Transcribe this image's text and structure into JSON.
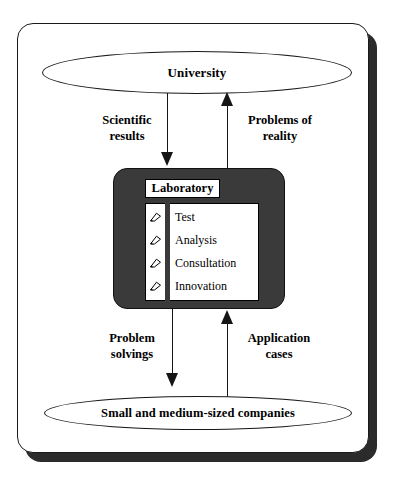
{
  "diagram": {
    "colors": {
      "frame_border": "#1a1a1a",
      "frame_shadow": "#2b2b2b",
      "panel_fill": "#3a3a3a",
      "line": "#151515",
      "text": "#000000",
      "background": "#ffffff"
    },
    "nodes": {
      "university": {
        "label": "University",
        "shape": "ellipse"
      },
      "companies": {
        "label": "Small and medium-sized companies",
        "shape": "ellipse"
      },
      "laboratory": {
        "label": "Laboratory",
        "shape": "rounded-rectangle",
        "items": [
          {
            "bullet_icon": "pointer-arrow-icon",
            "label": "Test"
          },
          {
            "bullet_icon": "pointer-arrow-icon",
            "label": "Analysis"
          },
          {
            "bullet_icon": "pointer-arrow-icon",
            "label": "Consultation"
          },
          {
            "bullet_icon": "pointer-arrow-icon",
            "label": "Innovation"
          }
        ]
      }
    },
    "edges": [
      {
        "id": "scientific-results",
        "from": "university",
        "to": "laboratory",
        "direction": "down",
        "label_line1": "Scientific",
        "label_line2": "results"
      },
      {
        "id": "problems-of-reality",
        "from": "laboratory",
        "to": "university",
        "direction": "up",
        "label_line1": "Problems of",
        "label_line2": "reality"
      },
      {
        "id": "problem-solvings",
        "from": "laboratory",
        "to": "companies",
        "direction": "down",
        "label_line1": "Problem",
        "label_line2": "solvings"
      },
      {
        "id": "application-cases",
        "from": "companies",
        "to": "laboratory",
        "direction": "up",
        "label_line1": "Application",
        "label_line2": "cases"
      }
    ]
  }
}
